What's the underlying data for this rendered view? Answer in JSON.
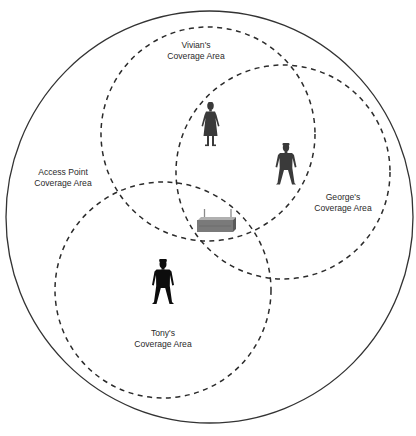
{
  "diagram": {
    "outer_area": {
      "label_line1": "Access Point",
      "label_line2": "Coverage Area",
      "stroke": "#333333",
      "style": "solid"
    },
    "coverage_areas": [
      {
        "id": "vivian",
        "label_line1": "Vivian's",
        "label_line2": "Coverage Area",
        "style": "dashed",
        "person": "woman"
      },
      {
        "id": "george",
        "label_line1": "George's",
        "label_line2": "Coverage Area",
        "style": "dashed",
        "person": "man"
      },
      {
        "id": "tony",
        "label_line1": "Tony's",
        "label_line2": "Coverage Area",
        "style": "dashed",
        "person": "man"
      }
    ],
    "center_device": {
      "type": "wireless-access-point",
      "color": "#7a7a7a"
    },
    "colors": {
      "vivian_figure": "#3a3a3a",
      "george_figure": "#3a3a3a",
      "tony_figure": "#0d0d0d",
      "dashed_stroke": "#2b2b2b"
    }
  }
}
